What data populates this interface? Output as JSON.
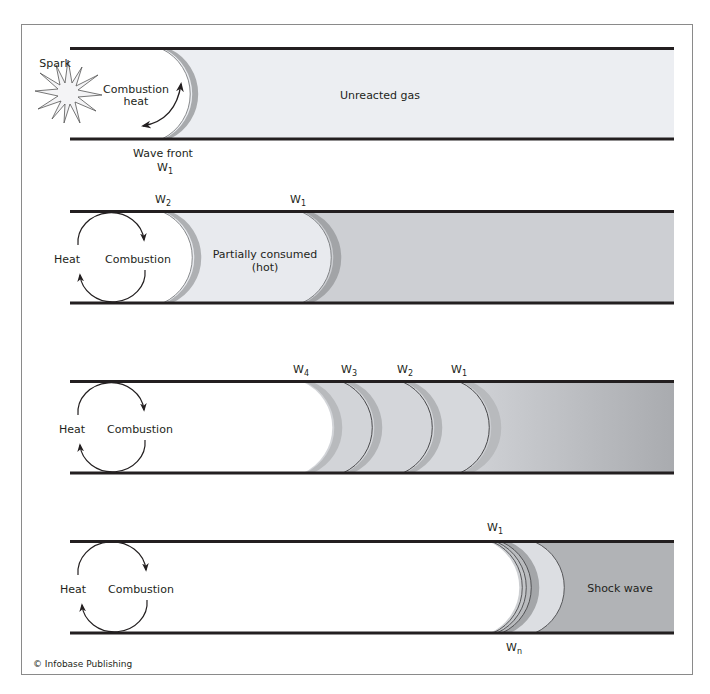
{
  "diagram": {
    "colors": {
      "frame": "#8a8a8a",
      "tube_wall": "#231f20",
      "unreacted_light": "#eceef2",
      "partially_consumed": "#e8eaee",
      "stage2_unreacted": "#cdcfd3",
      "stage3_unreacted": "#adafb3",
      "stage4_shock": "#b1b3b6",
      "wave_band": "#d4d6da",
      "shadow": "#9a9c9f"
    },
    "panels": [
      {
        "id": "stage-1",
        "labels": {
          "spark": "Spark",
          "combustion_line1": "Combustion",
          "combustion_line2": "heat",
          "unreacted": "Unreacted gas",
          "wave_front_line1": "Wave front",
          "wave_front_w": "W",
          "wave_front_sub": "1"
        }
      },
      {
        "id": "stage-2",
        "labels": {
          "heat": "Heat",
          "combustion": "Combustion",
          "partially_line1": "Partially consumed",
          "partially_line2": "(hot)",
          "w2": "W",
          "w2_sub": "2",
          "w1": "W",
          "w1_sub": "1"
        }
      },
      {
        "id": "stage-3",
        "labels": {
          "heat": "Heat",
          "combustion": "Combustion",
          "w4": "W",
          "w4_sub": "4",
          "w3": "W",
          "w3_sub": "3",
          "w2": "W",
          "w2_sub": "2",
          "w1": "W",
          "w1_sub": "1"
        }
      },
      {
        "id": "stage-4",
        "labels": {
          "heat": "Heat",
          "combustion": "Combustion",
          "shock": "Shock wave",
          "w1": "W",
          "w1_sub": "1",
          "wn": "W",
          "wn_sub": "n"
        }
      }
    ],
    "credit": "© Infobase Publishing"
  }
}
